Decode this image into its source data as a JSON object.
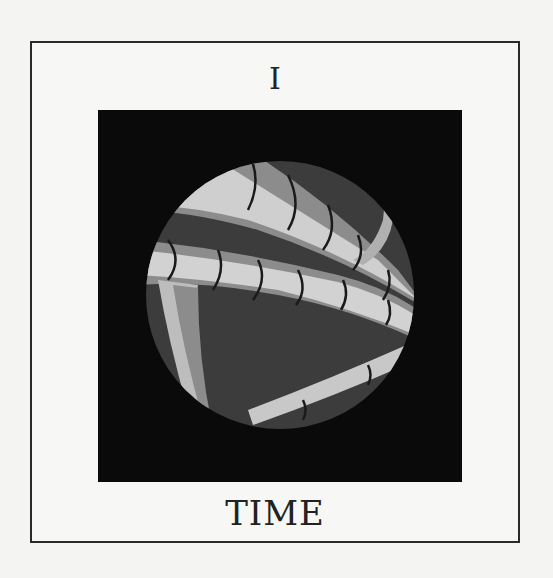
{
  "card": {
    "numeral": "I",
    "title": "TIME",
    "colors": {
      "background": "#f4f4f2",
      "border": "#2a2a2a",
      "art_frame": "#0a0a0a",
      "circle_dark": "#3a3a3a",
      "band_light": "#c8c8c8",
      "band_mid": "#8a8a8a",
      "line": "#1a1a1a"
    },
    "illustration": {
      "shape": "circle",
      "description": "Stylized curving bands in light and mid gray across a dark gray circle, segmented by dark curved lines"
    }
  }
}
